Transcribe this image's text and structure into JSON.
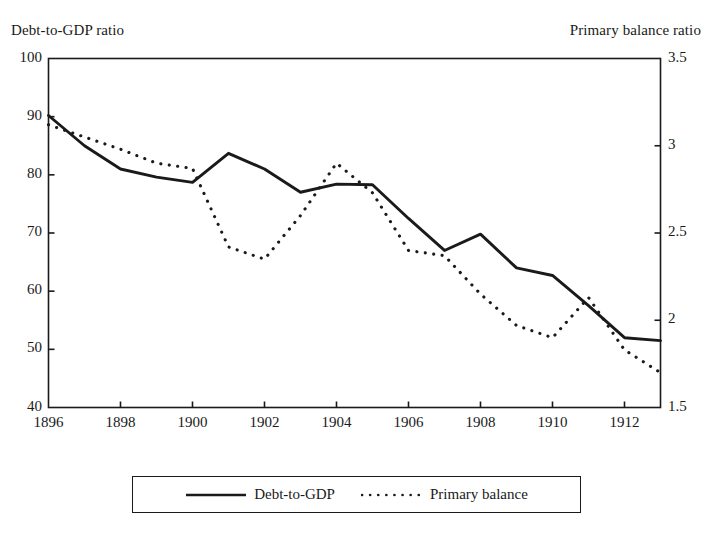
{
  "chart_data": {
    "type": "line",
    "title": "",
    "xlabel": "",
    "ylabel": "Debt-to-GDP ratio",
    "y2label": "Primary balance ratio",
    "xlim": [
      1896,
      1913
    ],
    "ylim": [
      40,
      100
    ],
    "y2lim": [
      1.5,
      3.5
    ],
    "grid": false,
    "legend_position": "bottom",
    "x": [
      1896,
      1897,
      1898,
      1899,
      1900,
      1901,
      1902,
      1903,
      1904,
      1905,
      1906,
      1907,
      1908,
      1909,
      1910,
      1911,
      1912,
      1913
    ],
    "xticks": [
      1896,
      1898,
      1900,
      1902,
      1904,
      1906,
      1908,
      1910,
      1912
    ],
    "xticklabels": [
      "1896",
      "1898",
      "1900",
      "1902",
      "1904",
      "1906",
      "1908",
      "1910",
      "1912"
    ],
    "yticks": [
      40,
      50,
      60,
      70,
      80,
      90,
      100
    ],
    "yticklabels": [
      "40",
      "50",
      "60",
      "70",
      "80",
      "90",
      "100"
    ],
    "y2ticks": [
      1.5,
      2,
      2.5,
      3,
      3.5
    ],
    "y2ticklabels": [
      "1.5",
      "2",
      "2.5",
      "3",
      "3.5"
    ],
    "series": [
      {
        "name": "Debt-to-GDP",
        "axis": "left",
        "style": "solid",
        "color": "#1a1a1a",
        "values": [
          90.2,
          85.0,
          81.0,
          79.6,
          78.7,
          83.7,
          81.0,
          77.0,
          78.4,
          78.3,
          72.5,
          67.0,
          69.8,
          64.0,
          62.7,
          57.5,
          52.0,
          51.5
        ]
      },
      {
        "name": "Primary balance",
        "axis": "right",
        "style": "dotted",
        "color": "#1a1a1a",
        "values": [
          3.12,
          3.05,
          2.98,
          2.9,
          2.87,
          2.42,
          2.35,
          2.6,
          2.9,
          2.73,
          2.4,
          2.37,
          2.15,
          1.97,
          1.9,
          2.13,
          1.83,
          1.7
        ]
      }
    ]
  },
  "legend": {
    "items": [
      {
        "label": "Debt-to-GDP",
        "style": "solid"
      },
      {
        "label": "Primary balance",
        "style": "dotted"
      }
    ]
  }
}
